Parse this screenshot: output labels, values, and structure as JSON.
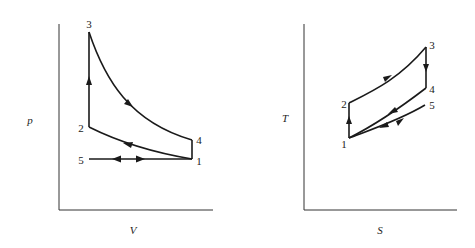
{
  "pv_diagram": {
    "x_axis_label": "V",
    "y_axis_label": "p",
    "points": {
      "1": "1",
      "2": "2",
      "3": "3",
      "4": "4",
      "5": "5"
    }
  },
  "ts_diagram": {
    "x_axis_label": "S",
    "y_axis_label": "T",
    "points": {
      "1": "1",
      "2": "2",
      "3": "3",
      "4": "4",
      "5": "5"
    }
  },
  "colors": {
    "line": "#1a1a1a",
    "background": "#ffffff"
  }
}
